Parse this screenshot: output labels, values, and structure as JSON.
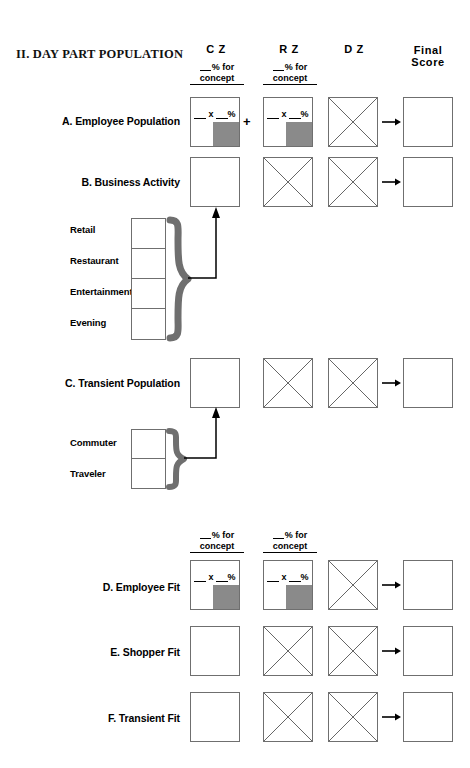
{
  "section": {
    "title": "II. DAY PART POPULATION"
  },
  "columns": [
    {
      "id": "cz",
      "label": "C Z"
    },
    {
      "id": "rz",
      "label": "R Z"
    },
    {
      "id": "dz",
      "label": "D Z"
    },
    {
      "id": "final",
      "label_line1": "Final",
      "label_line2": "Score"
    }
  ],
  "fraction_header": {
    "numerator": "% for",
    "denominator": "concept"
  },
  "cell_formula": {
    "multiply": "x",
    "percent": "%"
  },
  "operators": {
    "plus": "+",
    "arrow": "arrow-right-icon"
  },
  "rows": [
    {
      "id": "a",
      "label": "A. Employee Population",
      "cells": [
        "formula-shaded",
        "formula-shaded",
        "crossed",
        "empty"
      ],
      "has_plus": true,
      "has_fraction_headers": true
    },
    {
      "id": "b",
      "label": "B. Business Activity",
      "cells": [
        "empty",
        "crossed",
        "crossed",
        "empty"
      ],
      "has_plus": false,
      "has_fraction_headers": false
    },
    {
      "id": "c",
      "label": "C. Transient Population",
      "cells": [
        "empty",
        "crossed",
        "crossed",
        "empty"
      ],
      "has_plus": false,
      "has_fraction_headers": false
    },
    {
      "id": "d",
      "label": "D. Employee Fit",
      "cells": [
        "formula-shaded",
        "formula-shaded",
        "crossed",
        "empty"
      ],
      "has_plus": false,
      "has_fraction_headers": true
    },
    {
      "id": "e",
      "label": "E. Shopper Fit",
      "cells": [
        "empty",
        "crossed",
        "crossed",
        "empty"
      ],
      "has_plus": false,
      "has_fraction_headers": false
    },
    {
      "id": "f",
      "label": "F. Transient Fit",
      "cells": [
        "empty",
        "crossed",
        "crossed",
        "empty"
      ],
      "has_plus": false,
      "has_fraction_headers": false
    }
  ],
  "business_activity_group": {
    "items": [
      "Retail",
      "Restaurant",
      "Entertainment",
      "Evening"
    ],
    "brace": "curly-brace-icon",
    "connector": "connector-arrow-icon"
  },
  "transient_group": {
    "items": [
      "Commuter",
      "Traveler"
    ],
    "brace": "curly-brace-icon",
    "connector": "connector-arrow-icon"
  },
  "colors": {
    "shade": "#8a8a8a",
    "border": "#6f6f6f",
    "brace": "#6f6f6f",
    "text": "#000000"
  }
}
